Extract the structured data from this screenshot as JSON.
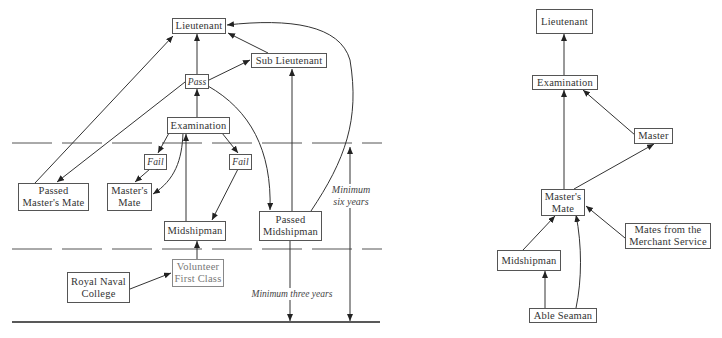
{
  "left_diagram": {
    "nodes": {
      "lieutenant": "Lieutenant",
      "sub_lieutenant": "Sub Lieutenant",
      "pass": "Pass",
      "examination": "Examination",
      "fail_left": "Fail",
      "fail_right": "Fail",
      "passed_masters_mate_l1": "Passed",
      "passed_masters_mate_l2": "Master's Mate",
      "masters_mate_l1": "Master's",
      "masters_mate_l2": "Mate",
      "midshipman": "Midshipman",
      "passed_midshipman_l1": "Passed",
      "passed_midshipman_l2": "Midshipman",
      "volunteer_l1": "Volunteer",
      "volunteer_l2": "First Class",
      "royal_naval_college_l1": "Royal Naval",
      "royal_naval_college_l2": "College"
    },
    "annotations": {
      "min_six_l1": "Minimum",
      "min_six_l2": "six years",
      "min_three": "Minimum three years"
    }
  },
  "right_diagram": {
    "nodes": {
      "lieutenant": "Lieutenant",
      "examination": "Examination",
      "master": "Master",
      "masters_mate_l1": "Master's",
      "masters_mate_l2": "Mate",
      "merchant_l1": "Mates from the",
      "merchant_l2": "Merchant Service",
      "midshipman": "Midshipman",
      "able_seaman": "Able Seaman"
    }
  }
}
